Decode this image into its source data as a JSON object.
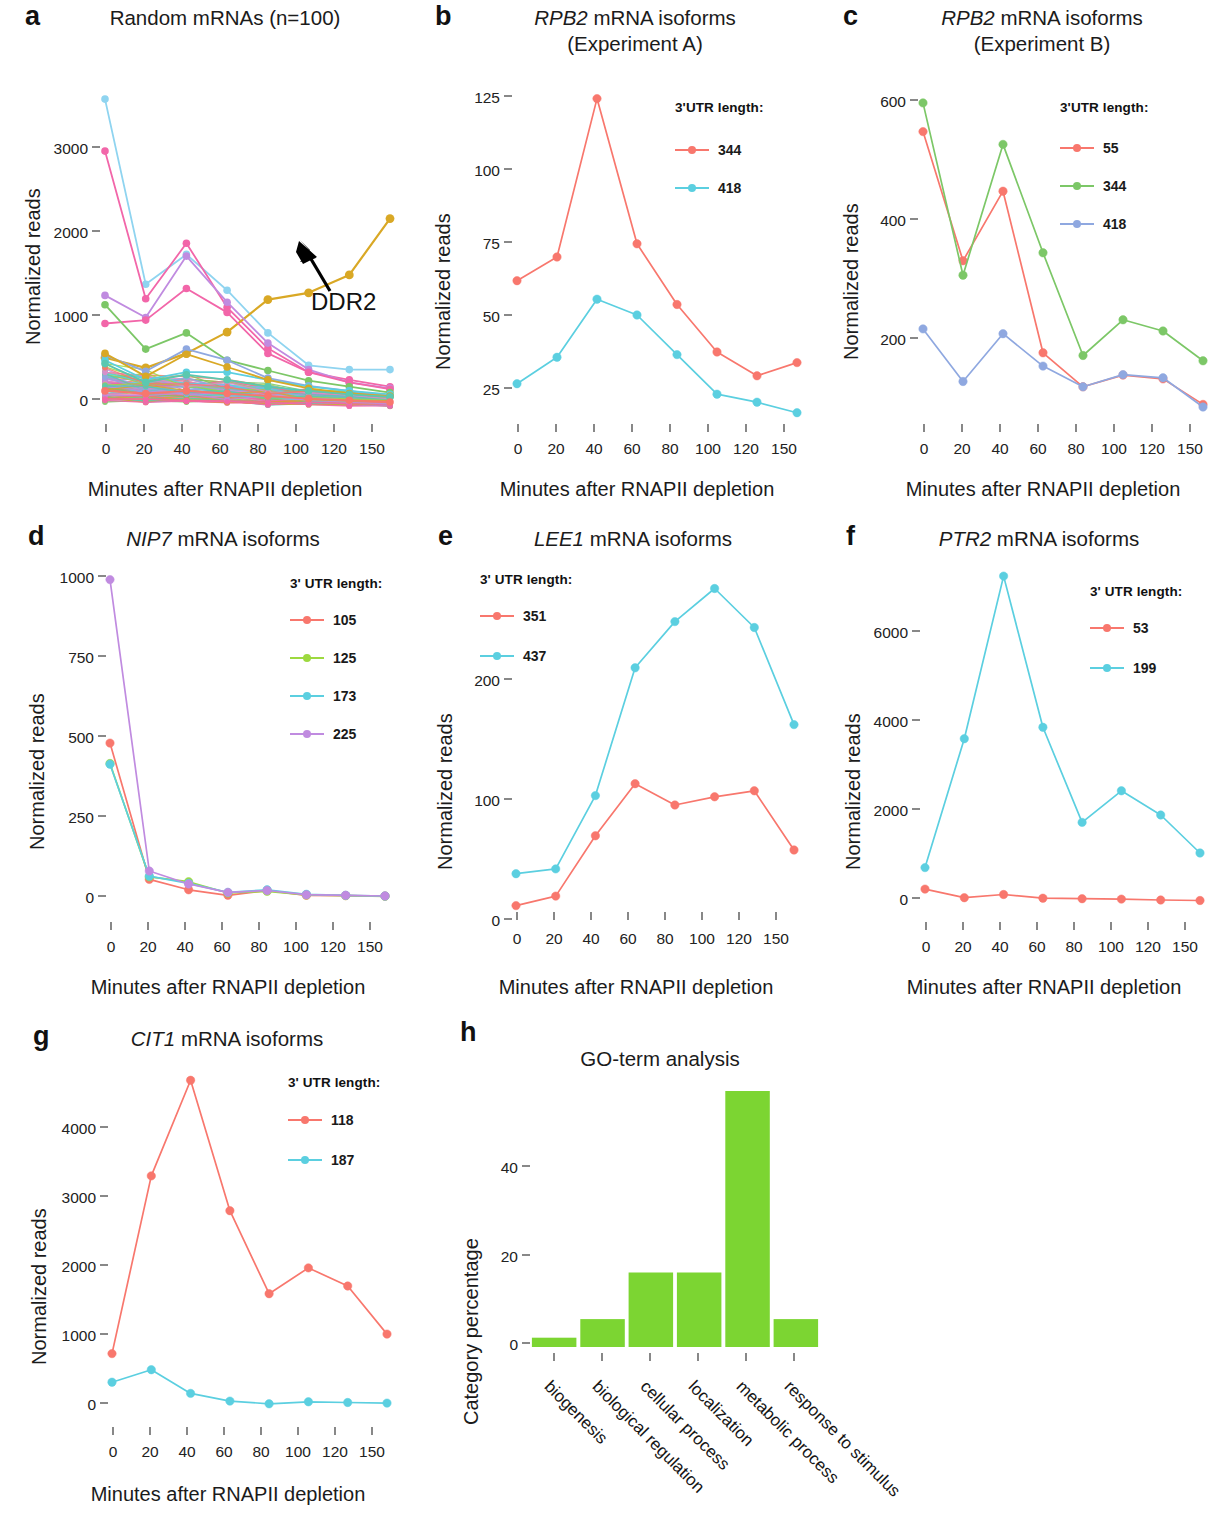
{
  "figure": {
    "xlabel": "Minutes after RNAPII depletion",
    "ylabel": "Normalized reads",
    "timepoints": [
      0,
      20,
      40,
      60,
      80,
      100,
      120,
      150
    ],
    "legend_title_tight": "3'UTR length:",
    "legend_title_spaced": "3' UTR length:"
  },
  "colors": {
    "red": "#F8776D",
    "salmon": "#F4796F",
    "green": "#7CC767",
    "cyan": "#5BCFE0",
    "blue": "#8FA8E0",
    "purple": "#C08BE0",
    "pink": "#F266A9",
    "gold": "#D9A825",
    "bar_green": "#7CD532"
  },
  "panels": {
    "a": {
      "letter": "a",
      "title": "Random mRNAs (n=100)",
      "annotation": "DDR2",
      "chart_data": {
        "type": "line",
        "title": "Random mRNAs (n=100)",
        "xlabel": "Minutes after RNAPII depletion",
        "ylabel": "Normalized reads",
        "x": [
          0,
          20,
          40,
          60,
          80,
          100,
          120,
          150
        ],
        "xtick_labels": [
          "0",
          "20",
          "40",
          "60",
          "80",
          "100",
          "120",
          "150"
        ],
        "ytick_labels": [
          "0",
          "1000",
          "2000",
          "3000"
        ],
        "yticks": [
          0,
          1000,
          2000,
          3000
        ],
        "ylim": [
          0,
          3750
        ],
        "grid": false,
        "legend": "none",
        "n_series": 100,
        "annotations": [
          {
            "text": "DDR2",
            "x": 120,
            "y": 1450
          }
        ],
        "series": [
          {
            "name": "cyan-top",
            "color": "#8FD4F0",
            "values": [
              3620,
              1450,
              1800,
              1380,
              880,
              500,
              450,
              450
            ]
          },
          {
            "name": "pink-top",
            "color": "#F266A9",
            "values": [
              3010,
              1280,
              1930,
              1180,
              700,
              420,
              330,
              250
            ]
          },
          {
            "name": "DDR2",
            "color": "#D9A825",
            "values": [
              590,
              470,
              640,
              890,
              1270,
              1350,
              1560,
              2220
            ]
          },
          {
            "name": "purple",
            "color": "#C08BE0",
            "values": [
              1320,
              1060,
              1780,
              1240,
              760,
              450,
              300,
              230
            ]
          },
          {
            "name": "magenta",
            "color": "#F266A9",
            "values": [
              990,
              1030,
              1400,
              1120,
              640,
              420,
              300,
              220
            ]
          },
          {
            "name": "green",
            "color": "#7CC767",
            "values": [
              1210,
              690,
              880,
              560,
              440,
              320,
              250,
              180
            ]
          },
          {
            "name": "blue-mid",
            "color": "#8FA8E0",
            "values": [
              620,
              430,
              690,
              560,
              350,
              260,
              200,
              140
            ]
          },
          {
            "name": "cyan-mid",
            "color": "#5BCFE0",
            "values": [
              560,
              330,
              420,
              420,
              330,
              250,
              200,
              160
            ]
          },
          {
            "name": "gold-mid",
            "color": "#D9A825",
            "values": [
              640,
              370,
              630,
              480,
              330,
              230,
              170,
              140
            ]
          },
          {
            "name": "teal-low",
            "color": "#5BC8B0",
            "values": [
              520,
              300,
              390,
              330,
              250,
              200,
              160,
              130
            ]
          },
          {
            "name": "bulk",
            "color": "#F8776D",
            "values": [
              200,
              170,
              200,
              170,
              140,
              110,
              90,
              70
            ]
          }
        ]
      }
    },
    "b": {
      "letter": "b",
      "title_line1": "RPB2 mRNA isoforms",
      "title_line2": "(Experiment A)",
      "title_italic": "RPB2",
      "chart_data": {
        "type": "line",
        "title": "RPB2 mRNA isoforms (Experiment A)",
        "xlabel": "Minutes after RNAPII depletion",
        "ylabel": "Normalized reads",
        "x": [
          0,
          20,
          40,
          60,
          80,
          100,
          120,
          150
        ],
        "xtick_labels": [
          "0",
          "20",
          "40",
          "60",
          "80",
          "100",
          "120",
          "150"
        ],
        "ytick_labels": [
          "25",
          "50",
          "75",
          "100",
          "125"
        ],
        "yticks": [
          25,
          50,
          75,
          100,
          125
        ],
        "ylim": [
          5,
          130
        ],
        "grid": false,
        "legend_title": "3'UTR length:",
        "legend_position": "top-right",
        "series": [
          {
            "name": "344",
            "color": "#F8776D",
            "values": [
              57,
              66,
              126,
              71,
              48,
              30,
              21,
              26
            ]
          },
          {
            "name": "418",
            "color": "#5BCFE0",
            "values": [
              18,
              28,
              50,
              44,
              29,
              14,
              11,
              7
            ]
          }
        ]
      }
    },
    "c": {
      "letter": "c",
      "title_line1": "RPB2 mRNA isoforms",
      "title_line2": "(Experiment B)",
      "title_italic": "RPB2",
      "chart_data": {
        "type": "line",
        "title": "RPB2 mRNA isoforms (Experiment B)",
        "xlabel": "Minutes after RNAPII depletion",
        "ylabel": "Normalized reads",
        "x": [
          0,
          20,
          40,
          60,
          80,
          100,
          120,
          150
        ],
        "xtick_labels": [
          "0",
          "20",
          "40",
          "60",
          "80",
          "100",
          "120",
          "150"
        ],
        "ytick_labels": [
          "200",
          "400",
          "600"
        ],
        "yticks": [
          200,
          400,
          600
        ],
        "ylim": [
          10,
          640
        ],
        "grid": false,
        "legend_title": "3'UTR length:",
        "legend_position": "top-right",
        "series": [
          {
            "name": "55",
            "color": "#F8776D",
            "values": [
              558,
              315,
              446,
              142,
              78,
              100,
              93,
              45
            ]
          },
          {
            "name": "344",
            "color": "#7CC767",
            "values": [
              612,
              288,
              534,
              330,
              137,
              204,
              183,
              127
            ]
          },
          {
            "name": "418",
            "color": "#8FA8E0",
            "values": [
              187,
              88,
              178,
              117,
              78,
              101,
              95,
              40
            ]
          }
        ]
      }
    },
    "d": {
      "letter": "d",
      "title": "NIP7 mRNA isoforms",
      "title_italic": "NIP7",
      "chart_data": {
        "type": "line",
        "title": "NIP7 mRNA isoforms",
        "xlabel": "Minutes after RNAPII depletion",
        "ylabel": "Normalized reads",
        "x": [
          0,
          20,
          40,
          60,
          80,
          100,
          120,
          150
        ],
        "xtick_labels": [
          "0",
          "20",
          "40",
          "60",
          "80",
          "100",
          "120",
          "150"
        ],
        "ytick_labels": [
          "0",
          "250",
          "500",
          "750",
          "1000"
        ],
        "yticks": [
          0,
          250,
          500,
          750,
          1000
        ],
        "ylim": [
          -20,
          1030
        ],
        "grid": false,
        "legend_title": "3' UTR length:",
        "legend_position": "top-right",
        "series": [
          {
            "name": "105",
            "color": "#F8776D",
            "values": [
              483,
              62,
              30,
              13,
              28,
              13,
              12,
              11
            ]
          },
          {
            "name": "125",
            "color": "#9DD93F",
            "values": [
              420,
              70,
              55,
              20,
              25,
              14,
              12,
              10
            ]
          },
          {
            "name": "173",
            "color": "#5BCFE0",
            "values": [
              418,
              72,
              50,
              22,
              30,
              16,
              13,
              11
            ]
          },
          {
            "name": "225",
            "color": "#C08BE0",
            "values": [
              988,
              88,
              48,
              22,
              28,
              15,
              13,
              11
            ]
          }
        ]
      }
    },
    "e": {
      "letter": "e",
      "title": "LEE1 mRNA isoforms",
      "title_italic": "LEE1",
      "chart_data": {
        "type": "line",
        "title": "LEE1 mRNA isoforms",
        "xlabel": "Minutes after RNAPII depletion",
        "ylabel": "Normalized reads",
        "x": [
          0,
          20,
          40,
          60,
          80,
          100,
          120,
          150
        ],
        "xtick_labels": [
          "0",
          "20",
          "40",
          "60",
          "80",
          "100",
          "120",
          "150"
        ],
        "ytick_labels": [
          "0",
          "100",
          "200"
        ],
        "yticks": [
          0,
          100,
          200
        ],
        "ylim": [
          0,
          300
        ],
        "grid": false,
        "legend_title": "3' UTR length:",
        "legend_position": "top-left",
        "series": [
          {
            "name": "351",
            "color": "#F8776D",
            "values": [
              13,
              21,
              72,
              116,
              98,
              105,
              110,
              60
            ]
          },
          {
            "name": "437",
            "color": "#5BCFE0",
            "values": [
              40,
              44,
              106,
              214,
              253,
              281,
              248,
              166
            ]
          }
        ]
      }
    },
    "f": {
      "letter": "f",
      "title": "PTR2 mRNA isoforms",
      "title_italic": "PTR2",
      "chart_data": {
        "type": "line",
        "title": "PTR2 mRNA isoforms",
        "xlabel": "Minutes after RNAPII depletion",
        "ylabel": "Normalized reads",
        "x": [
          0,
          20,
          40,
          60,
          80,
          100,
          120,
          150
        ],
        "xtick_labels": [
          "0",
          "20",
          "40",
          "60",
          "80",
          "100",
          "120",
          "150"
        ],
        "ytick_labels": [
          "0",
          "2000",
          "4000",
          "6000"
        ],
        "yticks": [
          0,
          2000,
          4000,
          6000
        ],
        "ylim": [
          -150,
          7400
        ],
        "grid": false,
        "legend_title": "3' UTR length:",
        "legend_position": "top-right",
        "series": [
          {
            "name": "53",
            "color": "#F8776D",
            "values": [
              330,
              140,
              210,
              130,
              120,
              110,
              90,
              80
            ]
          },
          {
            "name": "199",
            "color": "#5BCFE0",
            "values": [
              800,
              3620,
              7180,
              3870,
              1790,
              2480,
              1950,
              1120
            ]
          }
        ]
      }
    },
    "g": {
      "letter": "g",
      "title": "CIT1 mRNA isoforms",
      "title_italic": "CIT1",
      "chart_data": {
        "type": "line",
        "title": "CIT1 mRNA isoforms",
        "xlabel": "Minutes after RNAPII depletion",
        "ylabel": "Normalized reads",
        "x": [
          0,
          20,
          40,
          60,
          80,
          100,
          120,
          150
        ],
        "xtick_labels": [
          "0",
          "20",
          "40",
          "60",
          "80",
          "100",
          "120",
          "150"
        ],
        "ytick_labels": [
          "0",
          "1000",
          "2000",
          "3000",
          "4000"
        ],
        "yticks": [
          0,
          1000,
          2000,
          3000,
          4000
        ],
        "ylim": [
          -120,
          4900
        ],
        "grid": false,
        "legend_title": "3' UTR length:",
        "legend_position": "top-right",
        "series": [
          {
            "name": "118",
            "color": "#F8776D",
            "values": [
              760,
              3310,
              4680,
              2810,
              1620,
              1990,
              1730,
              1040
            ]
          },
          {
            "name": "187",
            "color": "#5BCFE0",
            "values": [
              350,
              530,
              190,
              80,
              40,
              70,
              60,
              50
            ]
          }
        ]
      }
    },
    "h": {
      "letter": "h",
      "title": "GO-term analysis",
      "chart_data": {
        "type": "bar",
        "title": "GO-term analysis",
        "xlabel": "",
        "ylabel": "Category percentage",
        "categories": [
          "biogenesis",
          "biological regulation",
          "cellular process",
          "localization",
          "metabolic process",
          "response to stimulus"
        ],
        "values": [
          2,
          6,
          16,
          16,
          55,
          6
        ],
        "ytick_labels": [
          "0",
          "20",
          "40"
        ],
        "yticks": [
          0,
          20,
          40
        ],
        "ylim": [
          0,
          58
        ],
        "grid": false,
        "bar_color": "#7CD532"
      }
    }
  }
}
